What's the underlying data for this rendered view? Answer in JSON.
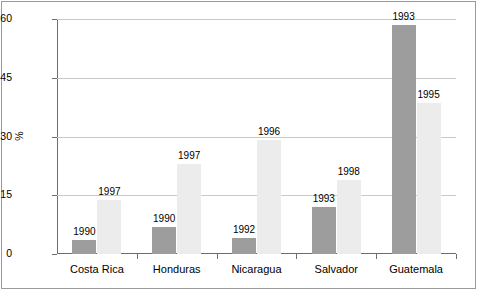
{
  "chart_data": {
    "type": "bar",
    "title": "",
    "subtitle": "",
    "xlabel": "",
    "ylabel": "%",
    "ylim": [
      0,
      60
    ],
    "yticks": [
      0,
      15,
      30,
      45,
      60
    ],
    "grid": true,
    "legend": false,
    "legend_position": "none",
    "categories": [
      "Costa Rica",
      "Honduras",
      "Nicaragua",
      "Salvador",
      "Guatemala"
    ],
    "series": [
      {
        "name": "earlier-year",
        "color": "#9d9d9d",
        "values": [
          3.7,
          7.0,
          4.0,
          12.0,
          58.5
        ],
        "point_labels": [
          "1990",
          "1990",
          "1992",
          "1993",
          "1993"
        ]
      },
      {
        "name": "later-year",
        "color": "#ececec",
        "values": [
          13.8,
          23.0,
          29.0,
          19.0,
          38.5
        ],
        "point_labels": [
          "1997",
          "1997",
          "1996",
          "1998",
          "1995"
        ]
      }
    ],
    "annotations": []
  },
  "axis": {
    "y_tick_labels": [
      "60",
      "45",
      "30",
      "15",
      "0"
    ],
    "y_axis_title": "%"
  }
}
